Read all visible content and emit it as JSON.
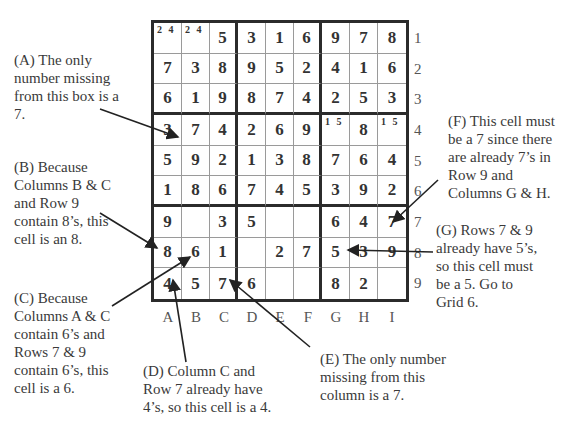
{
  "grid": {
    "rows": [
      [
        "",
        "",
        "5",
        "3",
        "1",
        "6",
        "9",
        "7",
        "8"
      ],
      [
        "7",
        "3",
        "8",
        "9",
        "5",
        "2",
        "4",
        "1",
        "6"
      ],
      [
        "6",
        "1",
        "9",
        "8",
        "7",
        "4",
        "2",
        "5",
        "3"
      ],
      [
        "3",
        "7",
        "4",
        "2",
        "6",
        "9",
        "",
        "8",
        ""
      ],
      [
        "5",
        "9",
        "2",
        "1",
        "3",
        "8",
        "7",
        "6",
        "4"
      ],
      [
        "1",
        "8",
        "6",
        "7",
        "4",
        "5",
        "3",
        "9",
        "2"
      ],
      [
        "9",
        "",
        "3",
        "5",
        "",
        "",
        "6",
        "4",
        "7"
      ],
      [
        "8",
        "6",
        "1",
        "",
        "2",
        "7",
        "5",
        "3",
        "9"
      ],
      [
        "4",
        "5",
        "7",
        "6",
        "",
        "",
        "8",
        "2",
        ""
      ]
    ],
    "candidates": {
      "0-0": "2 4",
      "0-1": "2 4",
      "3-6": "1 5",
      "3-8": "1 5"
    },
    "column_labels": [
      "A",
      "B",
      "C",
      "D",
      "E",
      "F",
      "G",
      "H",
      "I"
    ],
    "row_labels": [
      "1",
      "2",
      "3",
      "4",
      "5",
      "6",
      "7",
      "8",
      "9"
    ]
  },
  "annotations": {
    "A": {
      "text": "(A) The only\nnumber missing\nfrom this box is a\n7."
    },
    "B": {
      "text": "(B) Because\nColumns B & C\nand Row 9\ncontain 8’s, this\ncell is an 8."
    },
    "C": {
      "text": "(C) Because\nColumns A & C\ncontain 6’s and\nRows 7 & 9\ncontain 6’s, this\ncell is a 6."
    },
    "D": {
      "text": "(D) Column C and\nRow 7 already have\n4’s, so this cell is a 4."
    },
    "E": {
      "text": "(E) The only number\nmissing from this\ncolumn is a 7."
    },
    "F": {
      "text": "(F) This cell must\nbe a 7 since there\nare already 7’s in\nRow 9 and\nColumns G & H."
    },
    "G": {
      "text": "(G) Rows 7 & 9\nalready have 5’s,\nso this cell must\nbe a 5. Go to\nGrid 6."
    }
  },
  "colors": {
    "border": "#2b2b2b",
    "thin_line": "#9a9a9a",
    "text": "#3a3a3a"
  }
}
